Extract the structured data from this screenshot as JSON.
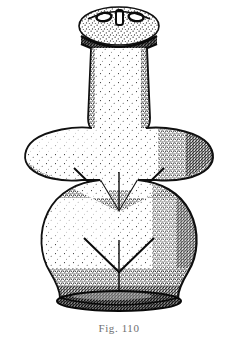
{
  "plate": {
    "caption": "Fig. 110",
    "background_color": "#ffffff",
    "ink_color": "#1a1a1a",
    "caption_color": "#6f6f6f",
    "title": "Fig. 110",
    "medium": "stippled line engraving",
    "subject": "anthropomorphic figurine"
  },
  "figure": {
    "name": "anthropomorphic-figurine",
    "parts": [
      {
        "id": "head",
        "label": "Head",
        "shape": "oval"
      },
      {
        "id": "eye-left",
        "label": "Left eye",
        "shape": "ellipse"
      },
      {
        "id": "eye-right",
        "label": "Right eye",
        "shape": "ellipse"
      },
      {
        "id": "nose",
        "label": "Nose bar",
        "shape": "vertical-bar"
      },
      {
        "id": "collar",
        "label": "Collar band",
        "shape": "dark-band"
      },
      {
        "id": "neck",
        "label": "Neck column",
        "shape": "tapered-column"
      },
      {
        "id": "arm-left",
        "label": "Left arm",
        "shape": "wing"
      },
      {
        "id": "arm-right",
        "label": "Right arm",
        "shape": "wing"
      },
      {
        "id": "chest-chevron",
        "label": "Chest chevron",
        "shape": "inverted-v"
      },
      {
        "id": "chest-line",
        "label": "Chest centre line",
        "shape": "vertical-line"
      },
      {
        "id": "hips",
        "label": "Hips / lower body",
        "shape": "rounded-bell"
      },
      {
        "id": "hip-chevron",
        "label": "Hip chevron",
        "shape": "inverted-v"
      },
      {
        "id": "hip-line",
        "label": "Hip centre line",
        "shape": "vertical-line"
      },
      {
        "id": "base",
        "label": "Base",
        "shape": "dark-ellipse"
      }
    ]
  }
}
